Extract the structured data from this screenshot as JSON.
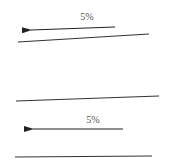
{
  "diagram": {
    "colors": {
      "line": "#333333",
      "arrow": "#222222",
      "text": "#555555",
      "background": "#ffffff"
    },
    "upper": {
      "arrow_label": "5%",
      "arrow_direction": "left",
      "arrow": {
        "x1": 115,
        "y1": 27,
        "x2": 31,
        "y2": 30
      },
      "label_pos": {
        "x": 87,
        "y": 20
      },
      "line": {
        "x1": 18,
        "y1": 42,
        "x2": 149,
        "y2": 34
      }
    },
    "lower": {
      "top_line": {
        "x1": 16,
        "y1": 101,
        "x2": 159,
        "y2": 96
      },
      "arrow_label": "5%",
      "arrow_direction": "left",
      "arrow": {
        "x1": 123,
        "y1": 129,
        "x2": 33,
        "y2": 129
      },
      "label_pos": {
        "x": 93,
        "y": 123
      },
      "bottom_line": {
        "x1": 15,
        "y1": 157,
        "x2": 152,
        "y2": 156
      }
    }
  }
}
